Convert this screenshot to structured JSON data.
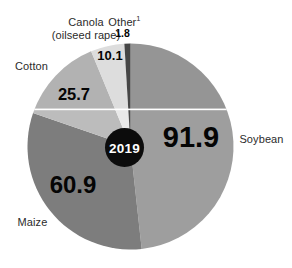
{
  "chart_data": {
    "type": "pie",
    "categories": [
      "Soybean",
      "Maize",
      "Cotton",
      "Canola (oilseed rape)",
      "Other"
    ],
    "values": [
      91.9,
      60.9,
      25.7,
      10.1,
      1.8
    ],
    "colors": [
      "#9e9e9e",
      "#7d7d7d",
      "#bcbcbc",
      "#e9e9e9",
      "#4a4a4a"
    ],
    "center_label": "2019",
    "start_angle_deg": 0,
    "direction": "clockwise",
    "title": "",
    "legend_position": "labels-around-pie"
  },
  "labels": {
    "canola_line1": "Canola",
    "canola_line2": "(oilseed rape)",
    "other": "Other",
    "other_sup": "1",
    "cotton": "Cotton",
    "soybean": "Soybean",
    "maize": "Maize",
    "year": "2019"
  }
}
